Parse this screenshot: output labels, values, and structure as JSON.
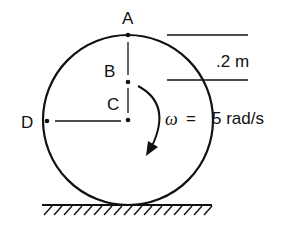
{
  "diagram": {
    "points": {
      "A": {
        "label": "A"
      },
      "B": {
        "label": "B"
      },
      "C": {
        "label": "C"
      },
      "D": {
        "label": "D"
      }
    },
    "dimension": {
      "label": ".2 m"
    },
    "angular_velocity": {
      "symbol": "ω",
      "equals": "=",
      "value": "5 rad/s"
    },
    "colors": {
      "stroke": "#111111",
      "background": "#ffffff"
    }
  }
}
